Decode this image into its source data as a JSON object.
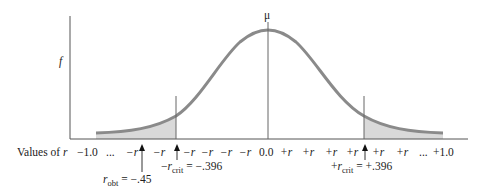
{
  "diagram": {
    "type": "sampling-distribution-of-r",
    "y_axis_label": "f",
    "mean_label": "μ",
    "x_axis": {
      "label_prefix": "Values of ",
      "label_var": "r",
      "ticks": [
        "−1.0",
        "...",
        "−r",
        "−r",
        "−r",
        "−r",
        "−r",
        "−r",
        "0.0",
        "+r",
        "+r",
        "+r",
        "+r",
        "+r",
        "+r",
        "...",
        "+1.0"
      ]
    },
    "annotations": {
      "r_obt": {
        "var": "r",
        "sub": "obt",
        "value": " = −.45"
      },
      "neg_r_crit": {
        "sign": "−",
        "var": "r",
        "sub": "crit",
        "value": " = −.396"
      },
      "pos_r_crit": {
        "sign": "+",
        "var": "r",
        "sub": "crit",
        "value": " = +.396"
      }
    },
    "colors": {
      "curve": "#8a8a8a",
      "shade": "#d9d9d9",
      "axis": "#555555"
    }
  }
}
